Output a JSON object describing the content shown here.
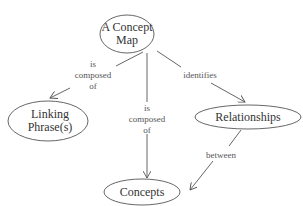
{
  "diagram": {
    "type": "concept-map",
    "nodes": [
      {
        "id": "concept-map",
        "lines": [
          "A Concept",
          "Map"
        ],
        "cx": 127,
        "cy": 35,
        "rx": 27,
        "ry": 19
      },
      {
        "id": "linking-phrases",
        "lines": [
          "Linking",
          "Phrase(s)"
        ],
        "cx": 47,
        "cy": 120,
        "rx": 40,
        "ry": 20
      },
      {
        "id": "relationships",
        "lines": [
          "Relationships"
        ],
        "cx": 248,
        "cy": 117,
        "rx": 53,
        "ry": 12
      },
      {
        "id": "concepts",
        "lines": [
          "Concepts"
        ],
        "cx": 142,
        "cy": 192,
        "rx": 38,
        "ry": 13
      }
    ],
    "edges": [
      {
        "from": "concept-map",
        "to": "linking-phrases",
        "label": [
          "is",
          "composed",
          "of"
        ]
      },
      {
        "from": "concept-map",
        "to": "concepts",
        "label": [
          "is",
          "composed",
          "of"
        ]
      },
      {
        "from": "concept-map",
        "to": "relationships",
        "label": [
          "identifies"
        ]
      },
      {
        "from": "relationships",
        "to": "concepts",
        "label": [
          "between"
        ]
      }
    ]
  },
  "nodes": {
    "concept_map": {
      "line1": "A Concept",
      "line2": "Map"
    },
    "linking_phrases": {
      "line1": "Linking",
      "line2": "Phrase(s)"
    },
    "relationships": {
      "line1": "Relationships"
    },
    "concepts": {
      "line1": "Concepts"
    }
  },
  "edges": {
    "to_linking": {
      "l1": "is",
      "l2": "composed",
      "l3": "of"
    },
    "to_concepts": {
      "l1": "is",
      "l2": "composed",
      "l3": "of"
    },
    "to_relationships": {
      "l1": "identifies"
    },
    "rel_to_concepts": {
      "l1": "between"
    }
  },
  "colors": {
    "stroke": "#555555",
    "text": "#333333",
    "background": "#ffffff"
  }
}
